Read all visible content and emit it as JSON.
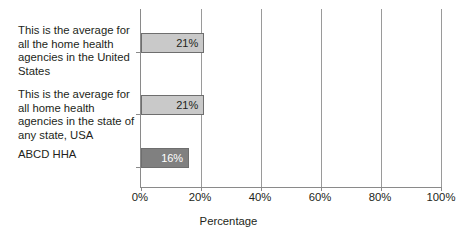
{
  "chart_data": {
    "type": "bar",
    "orientation": "horizontal",
    "title": "",
    "xlabel": "Percentage",
    "ylabel": "",
    "xlim": [
      0,
      100
    ],
    "xticks": [
      "0%",
      "20%",
      "40%",
      "60%",
      "80%",
      "100%"
    ],
    "xtick_values": [
      0,
      20,
      40,
      60,
      80,
      100
    ],
    "grid": "vertical gridlines at 20%, 40%, 60%, 80%",
    "legend": "none",
    "categories": [
      "This is the average for all the home health agencies in the United States",
      "This is the average for all home health agencies in the state of any state, USA",
      "ABCD HHA"
    ],
    "values": [
      21,
      21,
      16
    ],
    "value_labels": [
      "21%",
      "21%",
      "16%"
    ],
    "bar_colors": [
      "#c9c9c9",
      "#c9c9c9",
      "#808080"
    ],
    "bar_label_colors": [
      "#231f20",
      "#231f20",
      "#ffffff"
    ],
    "bar_border_color": "#6e6e6e"
  },
  "bars": [
    {
      "label": "This is the average for all the home health agencies in the United States",
      "value_label": "21%"
    },
    {
      "label": "This is the average for all home health agencies in the state of any state, USA",
      "value_label": "21%"
    },
    {
      "label": "ABCD HHA",
      "value_label": "16%"
    }
  ],
  "axis": {
    "x_title": "Percentage",
    "ticks": [
      "0%",
      "20%",
      "40%",
      "60%",
      "80%",
      "100%"
    ]
  }
}
